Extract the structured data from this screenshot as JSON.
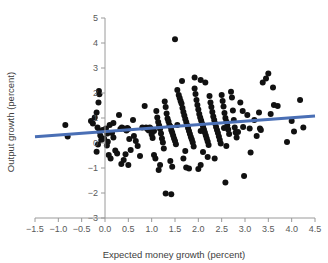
{
  "figure": {
    "background": "#ffffff",
    "point_color": "#111111",
    "trend_color": "#4a6fb5",
    "axis_color": "#9a9a9a"
  },
  "chart_data": {
    "type": "scatter",
    "title": "",
    "xlabel": "Expected money growth (percent)",
    "ylabel": "Output growth (percent)",
    "xlim": [
      -1.5,
      4.5
    ],
    "ylim": [
      -3,
      5
    ],
    "xticks": [
      -1.5,
      -1.0,
      -0.5,
      0.0,
      0.5,
      1.0,
      1.5,
      2.0,
      2.5,
      3.0,
      3.5,
      4.0,
      4.5
    ],
    "xticklabels": [
      "-1.5",
      "-1.0",
      "-0.5",
      "0.0",
      "0.5",
      "1.0",
      "1.5",
      "2.0",
      "2.5",
      "3.0",
      "3.5",
      "4.0",
      "4.5"
    ],
    "yticks": [
      -3,
      -2,
      -1,
      0,
      1,
      2,
      3,
      4,
      5
    ],
    "yticklabels": [
      "-3",
      "-2",
      "-1",
      "0",
      "1",
      "2",
      "3",
      "4",
      "5"
    ],
    "grid": false,
    "legend": null,
    "marker_size": 3.0,
    "trendline": {
      "type": "linear",
      "x": [
        -1.5,
        4.5
      ],
      "y": [
        0.25,
        1.08
      ],
      "slope": 0.1383,
      "intercept": 0.4575,
      "color": "#4a6fb5",
      "width": 3.2
    },
    "points": [
      [
        -0.13,
        2.08
      ],
      [
        -0.12,
        1.95
      ],
      [
        -0.14,
        1.62
      ],
      [
        -0.85,
        0.72
      ],
      [
        -0.8,
        0.26
      ],
      [
        -0.18,
        1.22
      ],
      [
        -0.22,
        1.02
      ],
      [
        -0.3,
        0.88
      ],
      [
        -0.26,
        0.78
      ],
      [
        -0.16,
        0.62
      ],
      [
        -0.12,
        0.46
      ],
      [
        -0.1,
        0.3
      ],
      [
        -0.08,
        0.12
      ],
      [
        -0.15,
        -0.06
      ],
      [
        -0.18,
        -0.35
      ],
      [
        -0.05,
        0.52
      ],
      [
        -0.02,
        0.18
      ],
      [
        0.02,
        0.58
      ],
      [
        0.05,
        0.38
      ],
      [
        0.06,
        0.05
      ],
      [
        0.04,
        -0.1
      ],
      [
        0.08,
        -0.48
      ],
      [
        0.12,
        -0.62
      ],
      [
        0.1,
        0.72
      ],
      [
        0.15,
        0.4
      ],
      [
        0.18,
        0.22
      ],
      [
        0.22,
        -0.3
      ],
      [
        0.26,
        -0.42
      ],
      [
        0.3,
        1.12
      ],
      [
        0.33,
        0.56
      ],
      [
        0.36,
        0.62
      ],
      [
        0.4,
        0.58
      ],
      [
        0.44,
        0.54
      ],
      [
        0.46,
        0.5
      ],
      [
        0.48,
        0.6
      ],
      [
        0.5,
        0.56
      ],
      [
        0.52,
        0.16
      ],
      [
        0.55,
        -0.28
      ],
      [
        0.44,
        -0.45
      ],
      [
        0.4,
        -0.68
      ],
      [
        0.5,
        -0.88
      ],
      [
        0.35,
        -0.84
      ],
      [
        0.62,
        0.28
      ],
      [
        0.66,
        0.08
      ],
      [
        0.7,
        -0.12
      ],
      [
        0.75,
        -0.52
      ],
      [
        0.8,
        0.62
      ],
      [
        0.85,
        1.48
      ],
      [
        0.88,
        0.62
      ],
      [
        0.9,
        0.58
      ],
      [
        0.92,
        0.54
      ],
      [
        0.94,
        0.5
      ],
      [
        0.96,
        0.62
      ],
      [
        0.98,
        0.58
      ],
      [
        1.0,
        0.34
      ],
      [
        1.02,
        0.2
      ],
      [
        1.05,
        -0.48
      ],
      [
        1.08,
        -0.62
      ],
      [
        1.1,
        1.28
      ],
      [
        1.12,
        1.02
      ],
      [
        1.14,
        0.84
      ],
      [
        1.16,
        0.7
      ],
      [
        1.18,
        0.56
      ],
      [
        1.2,
        0.38
      ],
      [
        1.22,
        0.18
      ],
      [
        1.24,
        0.02
      ],
      [
        1.26,
        -0.22
      ],
      [
        1.18,
        -0.88
      ],
      [
        1.15,
        -1.08
      ],
      [
        1.28,
        1.66
      ],
      [
        1.3,
        1.44
      ],
      [
        1.32,
        1.18
      ],
      [
        1.34,
        0.98
      ],
      [
        1.36,
        0.86
      ],
      [
        1.38,
        0.72
      ],
      [
        1.4,
        0.66
      ],
      [
        1.42,
        0.52
      ],
      [
        1.44,
        0.42
      ],
      [
        1.46,
        0.3
      ],
      [
        1.48,
        0.18
      ],
      [
        1.5,
        0.08
      ],
      [
        1.52,
        -0.05
      ],
      [
        1.4,
        -0.72
      ],
      [
        1.44,
        -0.95
      ],
      [
        1.3,
        -2.02
      ],
      [
        1.42,
        -2.05
      ],
      [
        1.5,
        4.15
      ],
      [
        1.55,
        2.12
      ],
      [
        1.58,
        1.92
      ],
      [
        1.6,
        1.8
      ],
      [
        1.62,
        1.68
      ],
      [
        1.64,
        1.58
      ],
      [
        1.66,
        1.4
      ],
      [
        1.68,
        1.24
      ],
      [
        1.7,
        1.1
      ],
      [
        1.72,
        0.96
      ],
      [
        1.74,
        0.84
      ],
      [
        1.76,
        0.72
      ],
      [
        1.78,
        0.6
      ],
      [
        1.8,
        0.48
      ],
      [
        1.82,
        0.36
      ],
      [
        1.84,
        0.24
      ],
      [
        1.86,
        0.14
      ],
      [
        1.88,
        0.02
      ],
      [
        1.9,
        -0.14
      ],
      [
        1.72,
        -0.32
      ],
      [
        1.68,
        -0.62
      ],
      [
        1.74,
        -0.98
      ],
      [
        1.8,
        -1.02
      ],
      [
        1.65,
        2.48
      ],
      [
        1.92,
        2.18
      ],
      [
        1.94,
        1.96
      ],
      [
        1.96,
        1.72
      ],
      [
        1.98,
        1.52
      ],
      [
        2.0,
        1.34
      ],
      [
        2.02,
        1.16
      ],
      [
        2.04,
        1.02
      ],
      [
        2.06,
        0.9
      ],
      [
        2.08,
        0.78
      ],
      [
        2.1,
        0.66
      ],
      [
        2.12,
        0.54
      ],
      [
        2.14,
        0.42
      ],
      [
        2.16,
        0.3
      ],
      [
        2.18,
        0.18
      ],
      [
        2.2,
        0.06
      ],
      [
        2.22,
        -0.08
      ],
      [
        2.1,
        -0.36
      ],
      [
        2.05,
        -0.88
      ],
      [
        2.0,
        -1.04
      ],
      [
        1.92,
        2.62
      ],
      [
        2.05,
        2.52
      ],
      [
        2.24,
        1.88
      ],
      [
        2.26,
        1.62
      ],
      [
        2.28,
        1.44
      ],
      [
        2.3,
        1.24
      ],
      [
        2.32,
        1.06
      ],
      [
        2.34,
        0.92
      ],
      [
        2.36,
        0.78
      ],
      [
        2.38,
        0.64
      ],
      [
        2.4,
        0.52
      ],
      [
        2.42,
        0.4
      ],
      [
        2.44,
        0.26
      ],
      [
        2.46,
        0.12
      ],
      [
        2.48,
        -0.02
      ],
      [
        2.2,
        -0.56
      ],
      [
        2.35,
        -0.62
      ],
      [
        2.15,
        2.42
      ],
      [
        2.5,
        1.92
      ],
      [
        2.52,
        1.68
      ],
      [
        2.54,
        1.46
      ],
      [
        2.56,
        1.2
      ],
      [
        2.58,
        1.0
      ],
      [
        2.6,
        0.86
      ],
      [
        2.62,
        0.7
      ],
      [
        2.64,
        0.54
      ],
      [
        2.66,
        0.36
      ],
      [
        2.6,
        -0.12
      ],
      [
        2.58,
        -1.58
      ],
      [
        2.7,
        2.05
      ],
      [
        2.72,
        1.82
      ],
      [
        2.74,
        1.3
      ],
      [
        2.76,
        0.92
      ],
      [
        2.78,
        0.62
      ],
      [
        2.8,
        0.42
      ],
      [
        2.82,
        0.22
      ],
      [
        2.85,
        0.44
      ],
      [
        2.9,
        1.62
      ],
      [
        2.95,
        1.28
      ],
      [
        2.96,
        0.64
      ],
      [
        2.98,
        -1.32
      ],
      [
        3.05,
        1.12
      ],
      [
        3.1,
        0.58
      ],
      [
        3.12,
        -0.38
      ],
      [
        3.2,
        0.92
      ],
      [
        3.25,
        0.28
      ],
      [
        3.3,
        1.22
      ],
      [
        3.32,
        0.58
      ],
      [
        3.34,
        0.52
      ],
      [
        3.38,
        2.42
      ],
      [
        3.45,
        2.58
      ],
      [
        3.5,
        2.78
      ],
      [
        3.55,
        1.16
      ],
      [
        3.6,
        2.22
      ],
      [
        3.62,
        1.52
      ],
      [
        3.7,
        1.48
      ],
      [
        3.9,
        0.04
      ],
      [
        4.0,
        0.88
      ],
      [
        4.05,
        0.46
      ],
      [
        4.18,
        1.72
      ],
      [
        4.25,
        0.62
      ],
      [
        0.18,
        0.8
      ],
      [
        0.6,
        0.92
      ],
      [
        1.05,
        0.48
      ],
      [
        1.55,
        0.72
      ],
      [
        2.05,
        0.48
      ],
      [
        2.55,
        0.6
      ]
    ]
  }
}
